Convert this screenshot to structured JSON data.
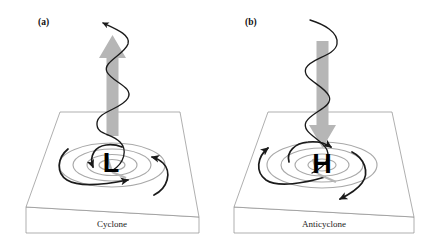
{
  "figure": {
    "kind": "meteorological-diagram",
    "background_color": "#ffffff",
    "width": 444,
    "height": 247
  },
  "panels": [
    {
      "id": "cyclone",
      "label": "(a)",
      "caption": "Cyclone",
      "pressure_symbol": "L",
      "pressure_meaning": "low-pressure center",
      "vertical_motion": "upward",
      "vertical_arrow_direction": "up",
      "vertical_arrow_color": "#b6b6b6",
      "surface_flow": "inward converging, counterclockwise",
      "helix_direction": "rising",
      "helix_has_arrowhead": true,
      "isobar_count": 4
    },
    {
      "id": "anticyclone",
      "label": "(b)",
      "caption": "Anticyclone",
      "pressure_symbol": "H",
      "pressure_meaning": "high-pressure center",
      "vertical_motion": "downward",
      "vertical_arrow_direction": "down",
      "vertical_arrow_color": "#b6b6b6",
      "surface_flow": "outward diverging, clockwise",
      "helix_direction": "sinking",
      "helix_has_arrowhead": false,
      "isobar_count": 4
    }
  ],
  "colors": {
    "ink": "#1a1a1a",
    "isobar_gray": "#a9a9a9",
    "shaft_gray": "#b6b6b6",
    "slab_outline": "#8d8d8d",
    "paper": "#ffffff"
  }
}
